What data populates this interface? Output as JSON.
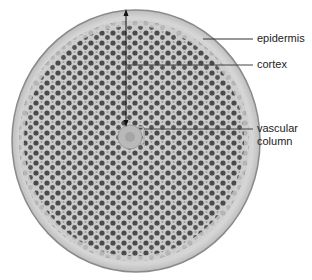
{
  "figure": {
    "labels": [
      {
        "id": "epidermis",
        "text": "epidermis"
      },
      {
        "id": "cortex",
        "text": "cortex"
      },
      {
        "id": "vascular",
        "line1": "vascular",
        "line2": "column"
      }
    ]
  }
}
